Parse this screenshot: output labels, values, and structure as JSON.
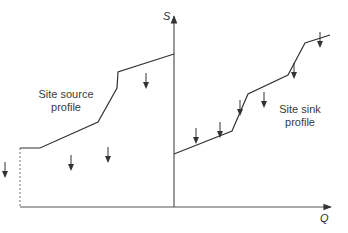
{
  "diagram": {
    "axes": {
      "y_label": "S",
      "x_label": "Q"
    },
    "labels": {
      "source": "Site source\nprofile",
      "sink": "Site sink\nprofile"
    },
    "colors": {
      "line": "#333333",
      "axis": "#555555",
      "dashed": "#888888"
    },
    "source_profile": {
      "points": [
        [
          20,
          148
        ],
        [
          40,
          148
        ],
        [
          98,
          122
        ],
        [
          117,
          88
        ],
        [
          118,
          72
        ],
        [
          174,
          54
        ]
      ],
      "dashed_start": [
        20,
        148
      ],
      "dashed_end": [
        20,
        207
      ],
      "arrows": [
        [
          5,
          162
        ],
        [
          71,
          155
        ],
        [
          108,
          147
        ],
        [
          146,
          73
        ]
      ]
    },
    "sink_profile": {
      "points": [
        [
          174,
          154
        ],
        [
          232,
          131
        ],
        [
          248,
          94
        ],
        [
          288,
          75
        ],
        [
          305,
          43
        ],
        [
          330,
          35
        ]
      ],
      "arrows": [
        [
          196,
          128
        ],
        [
          220,
          122
        ],
        [
          240,
          100
        ],
        [
          264,
          92
        ],
        [
          294,
          63
        ],
        [
          320,
          32
        ]
      ]
    }
  }
}
